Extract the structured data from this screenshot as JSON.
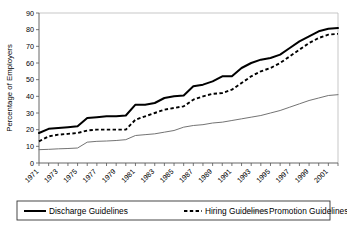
{
  "chart_data": {
    "type": "line",
    "title": "",
    "xlabel": "",
    "ylabel": "Percentage of Employers",
    "ylim": [
      0,
      90
    ],
    "xlim": [
      1971,
      2002
    ],
    "yticks": [
      0,
      10,
      20,
      30,
      40,
      50,
      60,
      70,
      80,
      90
    ],
    "xticks": [
      1971,
      1973,
      1975,
      1977,
      1979,
      1981,
      1983,
      1985,
      1987,
      1989,
      1991,
      1993,
      1995,
      1997,
      1999,
      2001
    ],
    "grid": false,
    "legend_position": "bottom",
    "x": [
      1971,
      1972,
      1973,
      1974,
      1975,
      1976,
      1977,
      1978,
      1979,
      1980,
      1981,
      1982,
      1983,
      1984,
      1985,
      1986,
      1987,
      1988,
      1989,
      1990,
      1991,
      1992,
      1993,
      1994,
      1995,
      1996,
      1997,
      1998,
      1999,
      2000,
      2001,
      2002
    ],
    "series": [
      {
        "name": "Discharge Guidelines",
        "style": "solid-thick",
        "color": "#000000",
        "values": [
          18,
          20.5,
          21,
          21.5,
          22,
          27,
          27.5,
          28,
          28,
          28.5,
          35,
          35,
          36,
          39,
          40,
          40.5,
          46,
          47,
          49,
          52,
          52,
          57,
          60,
          62,
          63,
          65,
          69,
          73,
          76,
          79,
          80.5,
          81
        ]
      },
      {
        "name": "Hiring Guidelines",
        "style": "dashed",
        "color": "#000000",
        "values": [
          13,
          16,
          17,
          17.5,
          18,
          19.5,
          20,
          20,
          20,
          20,
          26,
          28,
          30,
          32,
          33,
          34,
          38,
          40,
          41.5,
          42,
          44,
          48,
          52,
          55,
          57,
          60,
          64,
          68,
          72,
          75,
          77,
          77.5
        ]
      },
      {
        "name": "Promotion Guidelines",
        "style": "solid-thin",
        "color": "#6b6b6b",
        "values": [
          8,
          8.2,
          8.5,
          8.7,
          9,
          12.5,
          13,
          13.2,
          13.5,
          14,
          16.5,
          17,
          17.5,
          18.5,
          19.5,
          21.5,
          22.5,
          23,
          24,
          24.5,
          25.5,
          26.5,
          27.5,
          28.5,
          30,
          31.5,
          33.5,
          35.5,
          37.5,
          39,
          40.5,
          41
        ]
      }
    ],
    "legend": [
      {
        "label": "Discharge Guidelines",
        "style": "solid-thick"
      },
      {
        "label": "Hiring Guidelines",
        "style": "dashed"
      },
      {
        "label": "Promotion Guidelines",
        "style": "solid-thin"
      }
    ]
  }
}
